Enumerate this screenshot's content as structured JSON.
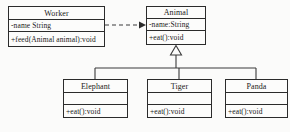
{
  "diagram": {
    "kind": "uml-class-diagram",
    "background_color": "#fbfbfa",
    "line_color": "#3a3a3a",
    "border_color": "#2b2b2b",
    "text_color": "#1a1a1a",
    "classes": {
      "worker": {
        "name": "Worker",
        "attributes": [
          "-name String"
        ],
        "operations": [
          "+feed(Animal animal):void"
        ]
      },
      "animal": {
        "name": "Animal",
        "attributes": [
          "-name:String"
        ],
        "operations": [
          "+eat():void"
        ]
      },
      "elephant": {
        "name": "Elephant",
        "attributes": [
          ""
        ],
        "operations": [
          "+eat():void"
        ]
      },
      "tiger": {
        "name": "Tiger",
        "attributes": [
          ""
        ],
        "operations": [
          "+eat():void"
        ]
      },
      "panda": {
        "name": "Panda",
        "attributes": [
          ""
        ],
        "operations": [
          "+eat():void"
        ]
      }
    },
    "relationships": [
      {
        "id": "dependency-worker-animal",
        "type": "dependency",
        "style": "dashed",
        "arrowhead": "open-filled",
        "from": "Worker",
        "to": "Animal"
      },
      {
        "id": "generalization-animal-subclasses",
        "type": "generalization",
        "style": "solid",
        "arrowhead": "hollow-triangle",
        "from": [
          "Elephant",
          "Tiger",
          "Panda"
        ],
        "to": "Animal"
      }
    ]
  }
}
